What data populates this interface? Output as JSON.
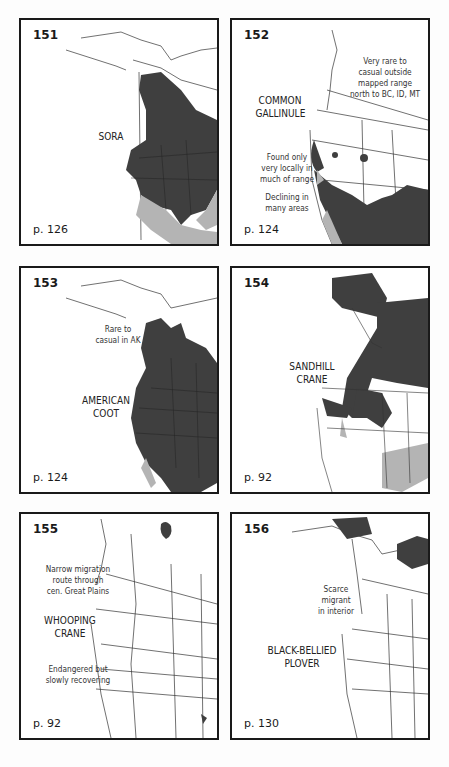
{
  "colors": {
    "range_dark": "#3f3f3f",
    "range_light": "#b4b4b4",
    "frame": "#1a1a1a"
  },
  "maps": [
    {
      "number": "151",
      "species": "SORA",
      "page": "p. 126",
      "notes": []
    },
    {
      "number": "152",
      "species": "COMMON\nGALLINULE",
      "page": "p. 124",
      "notes": [
        "Very rare to\ncasual outside\nmapped range\nnorth to BC, ID, MT",
        "Found only\nvery locally in\nmuch of range",
        "Declining in\nmany areas"
      ]
    },
    {
      "number": "153",
      "species": "AMERICAN\nCOOT",
      "page": "p. 124",
      "notes": [
        "Rare to\ncasual in AK"
      ]
    },
    {
      "number": "154",
      "species": "SANDHILL\nCRANE",
      "page": "p. 92",
      "notes": []
    },
    {
      "number": "155",
      "species": "WHOOPING\nCRANE",
      "page": "p. 92",
      "notes": [
        "Narrow migration\nroute through\ncen. Great Plains",
        "Endangered but\nslowly recovering"
      ]
    },
    {
      "number": "156",
      "species": "BLACK-BELLIED\nPLOVER",
      "page": "p. 130",
      "notes": [
        "Scarce\nmigrant\nin interior"
      ]
    }
  ]
}
